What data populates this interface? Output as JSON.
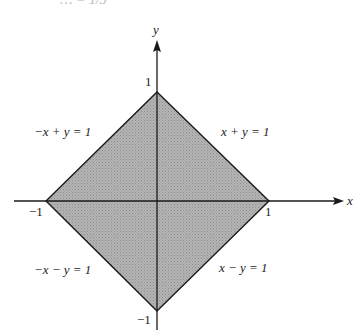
{
  "header": {
    "partial_text": "… = 1/3"
  },
  "diagram": {
    "type": "region-plot",
    "colors": {
      "fill": "#a9a9a9",
      "stroke": "#1a1a1a",
      "axis": "#1a1a1a",
      "background": "#ffffff"
    },
    "axes": {
      "x": {
        "label": "x",
        "tick_neg": "−1",
        "tick_pos": "1"
      },
      "y": {
        "label": "y",
        "tick_neg": "−1",
        "tick_pos": "1"
      }
    },
    "vertices": [
      [
        0,
        1
      ],
      [
        1,
        0
      ],
      [
        0,
        -1
      ],
      [
        -1,
        0
      ]
    ],
    "boundary_lines": {
      "upper_left": "−x + y = 1",
      "upper_right": "x + y = 1",
      "lower_left": "−x − y = 1",
      "lower_right": "x − y = 1"
    }
  }
}
